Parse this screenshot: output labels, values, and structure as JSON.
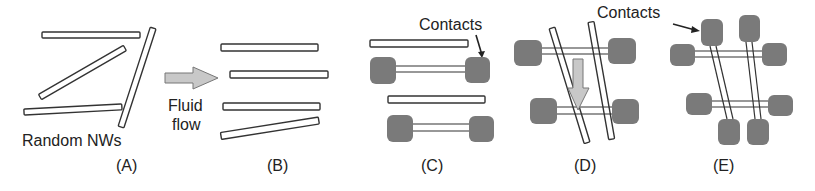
{
  "figure": {
    "panels": [
      {
        "id": "A",
        "label": "(A)",
        "caption": "Random NWs"
      },
      {
        "id": "B",
        "label": "(B)",
        "caption": "Fluid",
        "caption2": "flow"
      },
      {
        "id": "C",
        "label": "(C)",
        "caption": "Contacts"
      },
      {
        "id": "D",
        "label": "(D)"
      },
      {
        "id": "E",
        "label": "(E)",
        "caption": "Contacts"
      }
    ],
    "colors": {
      "nanowire_stroke": "#333333",
      "nanowire_fill": "#ffffff",
      "contact_fill": "#7a7a7a",
      "arrow_fill": "#c8c8c8",
      "arrow_stroke": "#777777",
      "text": "#222222"
    }
  }
}
